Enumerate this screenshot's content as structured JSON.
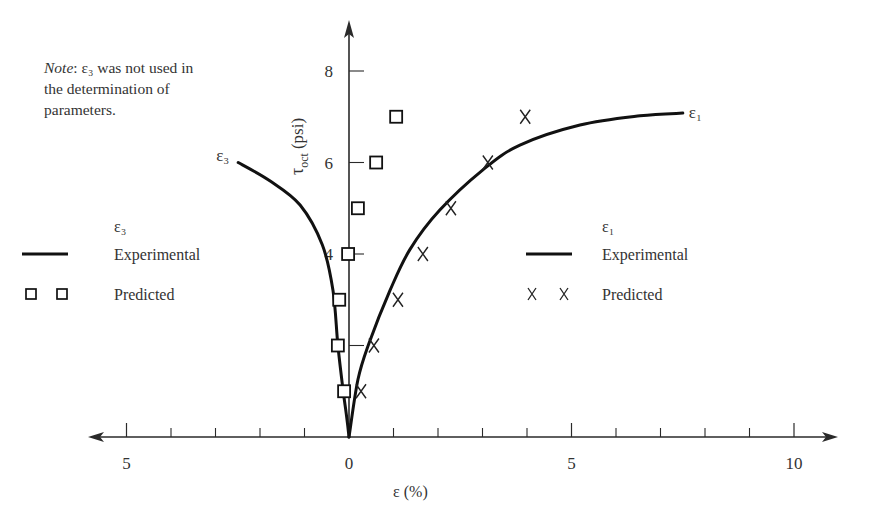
{
  "chart_data": {
    "type": "line",
    "title": "",
    "xlabel": "ε (%)",
    "ylabel": "τoct (psi)",
    "ylabel_main": "τ",
    "ylabel_sub": "oct",
    "ylabel_unit": "(psi)",
    "x_left_label": "ε3 increases to the left",
    "xlim": [
      -5.8,
      10.9
    ],
    "ylim": [
      0,
      9
    ],
    "x_ticks": [
      {
        "value": -5,
        "label": "5",
        "major": true
      },
      {
        "value": 0,
        "label": "0",
        "major": true
      },
      {
        "value": 5,
        "label": "5",
        "major": true
      },
      {
        "value": 10,
        "label": "10",
        "major": true
      }
    ],
    "x_minor_ticks": [
      -4,
      -3,
      -2,
      -1,
      1,
      2,
      3,
      4,
      6,
      7,
      8,
      9
    ],
    "y_ticks": [
      {
        "value": 2,
        "label": ""
      },
      {
        "value": 4,
        "label": "4"
      },
      {
        "value": 6,
        "label": "6"
      },
      {
        "value": 8,
        "label": "8"
      }
    ],
    "grid": false,
    "note": {
      "prefix": "Note",
      "text_line1": "ε₃ was not used in",
      "text_line2": "the determination of",
      "text_line3": "parameters."
    },
    "series": [
      {
        "name": "ε3 Experimental",
        "curve_label": "ε₃",
        "side": "left",
        "style": "solid-line",
        "points": [
          [
            0,
            0
          ],
          [
            0.06,
            0.5
          ],
          [
            0.13,
            1.0
          ],
          [
            0.25,
            2.0
          ],
          [
            0.36,
            3.2
          ],
          [
            0.6,
            4.2
          ],
          [
            1.1,
            5.07
          ],
          [
            1.78,
            5.6
          ],
          [
            2.49,
            6.0
          ]
        ]
      },
      {
        "name": "ε3 Predicted",
        "side": "left",
        "style": "square-marker",
        "points": [
          [
            0.11,
            1
          ],
          [
            0.25,
            2
          ],
          [
            0.22,
            3
          ],
          [
            0.02,
            4
          ],
          [
            -0.2,
            5
          ],
          [
            -0.61,
            6
          ],
          [
            -1.06,
            7
          ]
        ]
      },
      {
        "name": "ε1 Experimental",
        "curve_label": "ε₁",
        "side": "right",
        "style": "solid-line",
        "points": [
          [
            0,
            0
          ],
          [
            0.2,
            1.25
          ],
          [
            0.45,
            2.05
          ],
          [
            0.92,
            3.2
          ],
          [
            1.37,
            4.1
          ],
          [
            2.04,
            4.96
          ],
          [
            3.01,
            5.84
          ],
          [
            3.84,
            6.38
          ],
          [
            5.19,
            6.82
          ],
          [
            6.54,
            7.02
          ],
          [
            7.5,
            7.08
          ]
        ]
      },
      {
        "name": "ε1 Predicted",
        "side": "right",
        "style": "x-marker",
        "points": [
          [
            0.27,
            1
          ],
          [
            0.56,
            2
          ],
          [
            1.1,
            3
          ],
          [
            1.66,
            4
          ],
          [
            2.29,
            5
          ],
          [
            3.12,
            6
          ],
          [
            3.96,
            7
          ]
        ]
      }
    ],
    "legends": [
      {
        "position": "left",
        "heading": "ε₃",
        "entries": [
          {
            "symbol": "line",
            "label": "Experimental"
          },
          {
            "symbol": "square",
            "label": "Predicted"
          }
        ]
      },
      {
        "position": "right",
        "heading": "ε₁",
        "entries": [
          {
            "symbol": "line",
            "label": "Experimental"
          },
          {
            "symbol": "x",
            "label": "Predicted"
          }
        ]
      }
    ]
  }
}
